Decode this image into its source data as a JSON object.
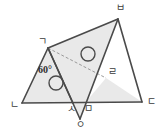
{
  "figure": {
    "type": "geometry-diagram",
    "title": "",
    "colors": {
      "stroke": "#4a4a4a",
      "fill": "#e9e9e9",
      "dashed_stroke": "#9a9a9a",
      "label_text": "#3b3b3b",
      "background": "#ffffff"
    },
    "points": [
      {
        "id": "giyeok",
        "label": "ㄱ",
        "x": 48,
        "y": 48,
        "label_x": 38,
        "label_y": 37
      },
      {
        "id": "nieun",
        "label": "ㄴ",
        "x": 22,
        "y": 103,
        "label_x": 10,
        "label_y": 100
      },
      {
        "id": "digeut",
        "label": "ㄷ",
        "x": 142,
        "y": 102,
        "label_x": 147,
        "label_y": 97
      },
      {
        "id": "rieul",
        "label": "ㄹ",
        "x": 106,
        "y": 78,
        "label_x": 108,
        "label_y": 67
      },
      {
        "id": "mieum",
        "label": "ㅁ",
        "x": 85,
        "y": 103,
        "label_x": 84,
        "label_y": 104
      },
      {
        "id": "bieup",
        "label": "ㅂ",
        "x": 118,
        "y": 19,
        "label_x": 116,
        "label_y": 3
      },
      {
        "id": "siot",
        "label": "ㅅ",
        "x": 73,
        "y": 103,
        "label_x": 67,
        "label_y": 104
      },
      {
        "id": "ieung",
        "label": "ㅇ",
        "x": 80,
        "y": 119,
        "label_x": 76,
        "label_y": 120
      }
    ],
    "angles": [
      {
        "at": "giyeok",
        "value": "60°",
        "label_x": 38,
        "label_y": 65
      }
    ],
    "congruence_marks": [
      {
        "id": "circle-mark-lower",
        "cx": 56,
        "cy": 83,
        "r": 7
      },
      {
        "id": "circle-mark-upper",
        "cx": 88,
        "cy": 54,
        "r": 7
      }
    ],
    "segments": [
      {
        "id": "seg-n-d",
        "from": "nieun",
        "to": "digeut",
        "style": "solid"
      },
      {
        "id": "seg-g-n",
        "from": "giyeok",
        "to": "nieun",
        "style": "solid"
      },
      {
        "id": "seg-g-s",
        "from": "giyeok",
        "to": "siot",
        "style": "solid"
      },
      {
        "id": "seg-g-o",
        "from": "giyeok",
        "to": "ieung",
        "style": "solid"
      },
      {
        "id": "seg-g-b",
        "from": "giyeok",
        "to": "bieup",
        "style": "solid"
      },
      {
        "id": "seg-b-o",
        "from": "bieup",
        "to": "ieung",
        "style": "solid"
      },
      {
        "id": "seg-b-d",
        "from": "bieup",
        "to": "digeut",
        "style": "solid"
      },
      {
        "id": "seg-g-r",
        "from": "giyeok",
        "to": "rieul",
        "style": "dashed"
      }
    ],
    "shaded_regions": [
      {
        "id": "region-g-n-s",
        "vertices": [
          "giyeok",
          "nieun",
          "siot"
        ]
      },
      {
        "id": "region-g-b-o",
        "vertices": [
          "giyeok",
          "bieup",
          "ieung"
        ]
      },
      {
        "id": "region-r-m-d",
        "vertices": [
          "rieul",
          "mieum",
          "digeut"
        ]
      }
    ]
  }
}
